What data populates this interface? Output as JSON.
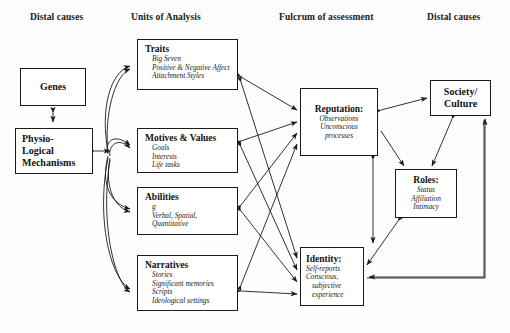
{
  "figure": {
    "column_headers": [
      {
        "id": "distal-left",
        "label": "Distal causes",
        "x": 30,
        "y": 18
      },
      {
        "id": "units",
        "label": "Units of Analysis",
        "x": 131,
        "y": 18
      },
      {
        "id": "fulcrum",
        "label": "Fulcrum of assessment",
        "x": 279,
        "y": 18
      },
      {
        "id": "distal-right",
        "label": "Distal causes",
        "x": 427,
        "y": 18
      }
    ],
    "nodes": [
      {
        "id": "genes",
        "title": "Genes",
        "items": [],
        "x": 20,
        "y": 68,
        "w": 66,
        "h": 38,
        "style": "plain"
      },
      {
        "id": "physiological-mechanisms",
        "title": "Physio-\nLogical\nMechanisms",
        "title_lines": [
          "Physio-",
          "Logical",
          "Mechanisms"
        ],
        "items": [],
        "x": 15,
        "y": 128,
        "w": 78,
        "h": 46,
        "style": "plain"
      },
      {
        "id": "traits",
        "title": "Traits",
        "items": [
          "Big Seven",
          "Positive & Negative Affect",
          "Attachment Styles"
        ],
        "x": 137,
        "y": 39,
        "w": 101,
        "h": 51,
        "style": "list"
      },
      {
        "id": "motives-values",
        "title": "Motives & Values",
        "items": [
          "Goals",
          "Interests",
          "Life tasks"
        ],
        "x": 137,
        "y": 128,
        "w": 101,
        "h": 45,
        "style": "list"
      },
      {
        "id": "abilities",
        "title": "Abilities",
        "items": [
          "g",
          "Verbal, Spatial,",
          "Quantitative"
        ],
        "x": 137,
        "y": 187,
        "w": 101,
        "h": 48,
        "style": "list"
      },
      {
        "id": "narratives",
        "title": "Narratives",
        "items": [
          "Stories",
          "Significant memories",
          "Scripts",
          "Ideological settings"
        ],
        "x": 137,
        "y": 255,
        "w": 101,
        "h": 56,
        "style": "list"
      },
      {
        "id": "reputation",
        "title": "Reputation:",
        "items": [
          "Observations",
          "Unconscious",
          "processes"
        ],
        "x": 300,
        "y": 88,
        "w": 78,
        "h": 68,
        "style": "center"
      },
      {
        "id": "identity",
        "title": "Identity:",
        "items": [
          "Self-reports",
          "Conscious,",
          "subjective",
          "experience"
        ],
        "x": 300,
        "y": 247,
        "w": 64,
        "h": 59,
        "style": "center-left"
      },
      {
        "id": "society-culture",
        "title": "Society/\nCulture",
        "title_lines": [
          "Society/",
          "Culture"
        ],
        "items": [],
        "x": 430,
        "y": 80,
        "w": 61,
        "h": 36,
        "style": "plain"
      },
      {
        "id": "roles",
        "title": "Roles:",
        "items": [
          "Status",
          "Affiliation",
          "Intimacy"
        ],
        "x": 395,
        "y": 169,
        "w": 62,
        "h": 49,
        "style": "center"
      }
    ],
    "edges": [
      {
        "id": "genes-physio",
        "from": "genes",
        "to": "physiological-mechanisms",
        "kind": "double",
        "shape": "straight"
      },
      {
        "id": "physio-bus",
        "from": "physiological-mechanisms",
        "to": "fan-bus",
        "kind": "double",
        "shape": "straight"
      },
      {
        "id": "physio-traits",
        "from": "physiological-mechanisms",
        "to": "traits",
        "kind": "single",
        "shape": "curved"
      },
      {
        "id": "physio-motives",
        "from": "physiological-mechanisms",
        "to": "motives-values",
        "kind": "single",
        "shape": "curved"
      },
      {
        "id": "physio-abilities",
        "from": "physiological-mechanisms",
        "to": "abilities",
        "kind": "single",
        "shape": "curved"
      },
      {
        "id": "physio-narratives",
        "from": "physiological-mechanisms",
        "to": "narratives",
        "kind": "single",
        "shape": "curved"
      },
      {
        "id": "traits-reputation",
        "from": "traits",
        "to": "reputation",
        "kind": "double",
        "shape": "straight"
      },
      {
        "id": "traits-identity",
        "from": "traits",
        "to": "identity",
        "kind": "double",
        "shape": "straight"
      },
      {
        "id": "motives-reputation",
        "from": "motives-values",
        "to": "reputation",
        "kind": "double",
        "shape": "straight"
      },
      {
        "id": "motives-identity",
        "from": "motives-values",
        "to": "identity",
        "kind": "double",
        "shape": "straight"
      },
      {
        "id": "abilities-reputation",
        "from": "abilities",
        "to": "reputation",
        "kind": "double",
        "shape": "straight"
      },
      {
        "id": "abilities-identity",
        "from": "abilities",
        "to": "identity",
        "kind": "double",
        "shape": "straight"
      },
      {
        "id": "narratives-reputation",
        "from": "narratives",
        "to": "reputation",
        "kind": "double",
        "shape": "straight"
      },
      {
        "id": "narratives-identity",
        "from": "narratives",
        "to": "identity",
        "kind": "double",
        "shape": "straight"
      },
      {
        "id": "reputation-identity",
        "from": "reputation",
        "to": "identity",
        "kind": "double",
        "shape": "straight"
      },
      {
        "id": "reputation-society",
        "from": "reputation",
        "to": "society-culture",
        "kind": "double",
        "shape": "straight"
      },
      {
        "id": "reputation-roles",
        "from": "reputation",
        "to": "roles",
        "kind": "single",
        "shape": "straight"
      },
      {
        "id": "society-roles",
        "from": "society-culture",
        "to": "roles",
        "kind": "double",
        "shape": "straight"
      },
      {
        "id": "roles-identity",
        "from": "roles",
        "to": "identity",
        "kind": "double",
        "shape": "straight"
      },
      {
        "id": "society-identity",
        "from": "society-culture",
        "to": "identity",
        "kind": "single",
        "shape": "elbow"
      },
      {
        "id": "identity-society",
        "from": "identity",
        "to": "society-culture",
        "kind": "single",
        "shape": "elbow"
      }
    ]
  },
  "colors": {
    "stroke": "#1b1b1b",
    "box_fill": "#ffffff",
    "background": "#fdfdfd",
    "text": "#111111"
  }
}
